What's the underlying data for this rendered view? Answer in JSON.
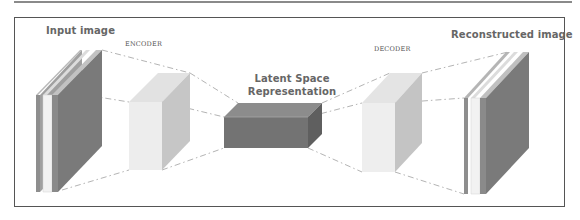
{
  "diagram": {
    "labels": {
      "input": "Input image",
      "encoder": "ENCODER",
      "latent_line1": "Latent Space",
      "latent_line2": "Representation",
      "decoder": "DECODER",
      "output": "Reconstructed image"
    },
    "components": [
      {
        "id": "input-image",
        "type": "image-stack",
        "layers": 3
      },
      {
        "id": "encoder",
        "type": "block",
        "shade": "light"
      },
      {
        "id": "latent-space",
        "type": "block",
        "shade": "dark"
      },
      {
        "id": "decoder",
        "type": "block",
        "shade": "light"
      },
      {
        "id": "reconstructed-image",
        "type": "image-stack",
        "layers": 3
      }
    ],
    "connections": [
      {
        "from": "input-image",
        "to": "encoder",
        "style": "dash-dot"
      },
      {
        "from": "encoder",
        "to": "latent-space",
        "style": "dash-dot"
      },
      {
        "from": "latent-space",
        "to": "decoder",
        "style": "dash-dot"
      },
      {
        "from": "decoder",
        "to": "reconstructed-image",
        "style": "dash-dot"
      }
    ],
    "colors": {
      "frame": "#555555",
      "label_text": "#666666",
      "light_block_front": "#ececec",
      "light_block_side": "#c4c4c4",
      "light_block_top": "#e2e2e2",
      "dark_block_front": "#727272",
      "dark_block_top": "#8a8a8a",
      "dark_block_side": "#5e5e5e",
      "image_dark": "#7a7a7a",
      "connector": "#b0b0b0"
    }
  }
}
